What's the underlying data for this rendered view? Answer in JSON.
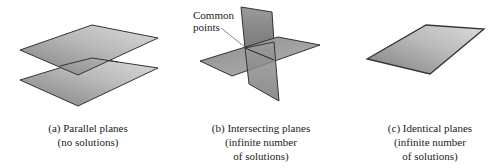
{
  "panels": [
    {
      "id": "a",
      "caption_lines": [
        "(a) Parallel planes",
        "(no solutions)"
      ]
    },
    {
      "id": "b",
      "caption_lines": [
        "(b) Intersecting planes",
        "(infinite number",
        "of solutions)"
      ],
      "callout_lines": [
        "Common",
        "points"
      ]
    },
    {
      "id": "c",
      "caption_lines": [
        "(c) Identical planes",
        "(infinite number",
        "of solutions)"
      ]
    }
  ],
  "colors": {
    "plane_light": "#d6d6d6",
    "plane_dark": "#8a8a8a",
    "edge": "#333333",
    "text": "#222222"
  }
}
